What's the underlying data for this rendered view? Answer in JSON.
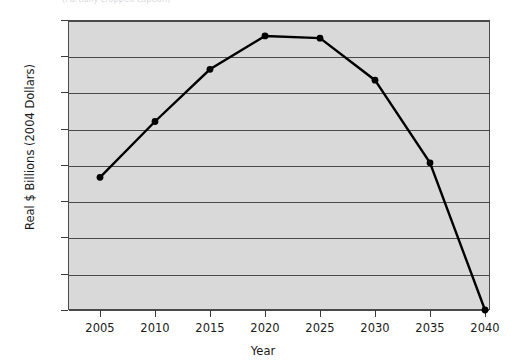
{
  "top_caption": "(Partially cropped caption)",
  "chart_data": {
    "type": "line",
    "title": "",
    "xlabel": "Year",
    "ylabel": "Real $ Billions (2004 Dollars)",
    "categories": [
      2005,
      2010,
      2015,
      2020,
      2025,
      2030,
      2035,
      2040
    ],
    "x_tick_labels": [
      "2005",
      "2010",
      "2015",
      "2020",
      "2025",
      "2030",
      "2035",
      "2040"
    ],
    "values": [
      1830,
      2600,
      3320,
      3780,
      3750,
      3170,
      2030,
      0
    ],
    "y_tick_labels": [
      "4000",
      "3500",
      "3000",
      "2500",
      "2000",
      "1500",
      "1000",
      "500",
      "0"
    ],
    "y_ticks": [
      4000,
      3500,
      3000,
      2500,
      2000,
      1500,
      1000,
      500,
      0
    ],
    "ylim": [
      0,
      4000
    ],
    "xlim": [
      2002.5,
      2042.5
    ],
    "grid": true,
    "legend": "none",
    "series": [
      {
        "name": "Real $ Billions (2004 Dollars)",
        "values": [
          1830,
          2600,
          3320,
          3780,
          3750,
          3170,
          2030,
          0
        ],
        "color": "#000000",
        "marker": "circle"
      }
    ],
    "colors": {
      "plot_background": "#d9d9d9",
      "page_background": "#ffffff",
      "gridline": "#4a4a4a",
      "axis": "#3a3a3a",
      "line": "#000000",
      "text": "#1a1a1a"
    }
  }
}
